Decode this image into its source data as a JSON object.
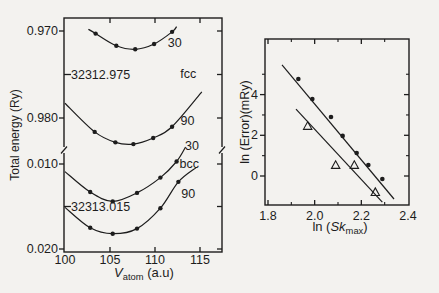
{
  "figure": {
    "background": "#f3f2ef",
    "ink": "#1d1d1d"
  },
  "chart_data": [
    {
      "id": "total-energy-vs-volume",
      "type": "line",
      "xlabel_parts": [
        {
          "t": "V",
          "style": "italic"
        },
        {
          "t": "atom",
          "style": "sub"
        },
        {
          "t": " (a.u)",
          "style": "normal"
        }
      ],
      "ylabel": "Total energy (Ry)",
      "x_ticks": [
        {
          "label": "100",
          "v": 100
        },
        {
          "label": "105",
          "v": 105
        },
        {
          "label": "110",
          "v": 110
        },
        {
          "label": "115",
          "v": 115
        }
      ],
      "xlim": [
        100,
        117.4
      ],
      "y_axis_break": true,
      "y_tick_labels": [
        {
          "label": "0.970",
          "value": -32312.97
        },
        {
          "label": "0.980",
          "value": -32312.98
        },
        {
          "label": "0.010",
          "value": -32313.01
        },
        {
          "label": "0.020",
          "value": -32313.02
        }
      ],
      "y_annotations": [
        {
          "label": "-32312.975",
          "value": -32312.975
        },
        {
          "label": "-32313.015",
          "value": -32313.015
        }
      ],
      "phase_labels": [
        {
          "text": "fcc",
          "x": 113.7,
          "y": -32312.9749
        },
        {
          "text": "bcc",
          "x": 113.8,
          "y": -32313.01
        }
      ],
      "series": [
        {
          "name": "fcc-30",
          "label": "30",
          "label_x": 112.2,
          "label_y": -32312.9714,
          "markers": [
            [
              103.4,
              -32312.9703
            ],
            [
              105.7,
              -32312.9717
            ],
            [
              107.8,
              -32312.9721
            ],
            [
              109.9,
              -32312.9715
            ],
            [
              111.9,
              -32312.9701
            ]
          ],
          "curve": [
            [
              102.6,
              -32312.9698
            ],
            [
              103.4,
              -32312.9703
            ],
            [
              105.7,
              -32312.9717
            ],
            [
              107.8,
              -32312.9721
            ],
            [
              109.9,
              -32312.9715
            ],
            [
              111.9,
              -32312.9701
            ],
            [
              112.4,
              -32312.9695
            ]
          ]
        },
        {
          "name": "fcc-90",
          "label": "90",
          "label_x": 113.6,
          "label_y": -32312.9803,
          "markers": [
            [
              103.3,
              -32312.9816
            ],
            [
              105.6,
              -32312.9828
            ],
            [
              107.6,
              -32312.983
            ],
            [
              109.8,
              -32312.9823
            ],
            [
              111.9,
              -32312.981
            ]
          ],
          "curve": [
            [
              100.0,
              -32312.9783
            ],
            [
              103.3,
              -32312.9816
            ],
            [
              105.6,
              -32312.9828
            ],
            [
              107.6,
              -32312.983
            ],
            [
              109.8,
              -32312.9823
            ],
            [
              111.9,
              -32312.981
            ],
            [
              115.2,
              -32312.977
            ]
          ]
        },
        {
          "name": "bcc-30",
          "label": "30",
          "label_x": 114.1,
          "label_y": -32313.0079,
          "markers": [
            [
              102.8,
              -32313.0133
            ],
            [
              105.3,
              -32313.0144
            ],
            [
              108.0,
              -32313.0134
            ],
            [
              110.6,
              -32313.0116
            ],
            [
              112.4,
              -32313.0097
            ]
          ],
          "curve": [
            [
              100.0,
              -32313.0109
            ],
            [
              102.8,
              -32313.0133
            ],
            [
              105.3,
              -32313.0144
            ],
            [
              108.0,
              -32313.0134
            ],
            [
              110.6,
              -32313.0116
            ],
            [
              112.4,
              -32313.0097
            ],
            [
              113.4,
              -32313.008
            ]
          ]
        },
        {
          "name": "bcc-90",
          "label": "90",
          "label_x": 113.7,
          "label_y": -32313.0135,
          "markers": [
            [
              102.8,
              -32313.0175
            ],
            [
              105.3,
              -32313.0182
            ],
            [
              108.0,
              -32313.0176
            ],
            [
              110.6,
              -32313.0152
            ],
            [
              112.6,
              -32313.0121
            ]
          ],
          "curve": [
            [
              100.0,
              -32313.0151
            ],
            [
              102.8,
              -32313.0175
            ],
            [
              105.3,
              -32313.0182
            ],
            [
              108.0,
              -32313.0176
            ],
            [
              110.6,
              -32313.0152
            ],
            [
              112.6,
              -32313.0121
            ],
            [
              114.6,
              -32313.0104
            ]
          ]
        }
      ]
    },
    {
      "id": "convergence-error",
      "type": "scatter",
      "xlabel_parts": [
        {
          "t": "ln (",
          "style": "normal"
        },
        {
          "t": "Sk",
          "style": "italic"
        },
        {
          "t": "max",
          "style": "sub"
        },
        {
          "t": ")",
          "style": "normal"
        }
      ],
      "ylabel": "ln (Error)(mRy)",
      "x_ticks": [
        {
          "label": "1.8",
          "v": 1.8
        },
        {
          "label": "2.0",
          "v": 2.0
        },
        {
          "label": "2.2",
          "v": 2.2
        },
        {
          "label": "2.4",
          "v": 2.4
        }
      ],
      "x_minor_ticks": [
        1.9,
        2.1,
        2.3
      ],
      "y_ticks": [
        {
          "label": "0",
          "v": 0
        },
        {
          "label": "2",
          "v": 2
        },
        {
          "label": "4",
          "v": 4
        }
      ],
      "y_minor_ticks": [
        1,
        3,
        5
      ],
      "xlim": [
        1.787,
        2.404
      ],
      "ylim": [
        -1.43,
        6.73
      ],
      "series": [
        {
          "name": "circle-series",
          "marker": "filled-circle",
          "points": [
            [
              1.93,
              4.77
            ],
            [
              1.99,
              3.78
            ],
            [
              2.07,
              2.9
            ],
            [
              2.12,
              1.97
            ],
            [
              2.18,
              1.13
            ],
            [
              2.23,
              0.54
            ],
            [
              2.29,
              -0.15
            ]
          ],
          "fit_line": [
            [
              1.86,
              5.46
            ],
            [
              2.34,
              -1.13
            ]
          ]
        },
        {
          "name": "triangle-series",
          "marker": "open-triangle",
          "points": [
            [
              1.97,
              2.46
            ],
            [
              2.09,
              0.54
            ],
            [
              2.17,
              0.54
            ],
            [
              2.26,
              -0.79
            ]
          ],
          "fit_line": [
            [
              1.92,
              3.29
            ],
            [
              2.29,
              -1.28
            ]
          ]
        }
      ]
    }
  ]
}
